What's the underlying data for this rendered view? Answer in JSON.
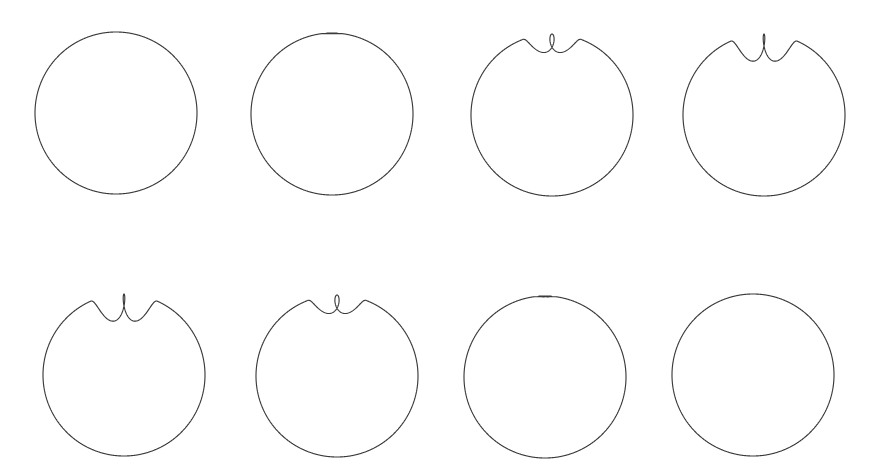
{
  "figure": {
    "background_color": "#ffffff",
    "stroke_color": "#3a3a3a",
    "stroke_width": 1.15,
    "canvas": {
      "width": 874,
      "height": 476
    },
    "grid": {
      "rows": 2,
      "columns": 4
    }
  },
  "chart_data": {
    "type": "line",
    "xlabel": "",
    "ylabel": "",
    "grid": false,
    "legend_position": "none",
    "curve_family": "epitrochoid",
    "parametric_form": "x = cx + (R + r) * cos(t) - d * cos(((R + r) / r) * t);  y = cy + (R + r) * sin(t) - d * sin(((R + r) / r) * t)",
    "panels": [
      {
        "index": 1,
        "row": 1,
        "column": 1,
        "label": "plain circle",
        "center": [
          116,
          113
        ],
        "radius": 81,
        "loop_amplitude": 0.0,
        "loop_width": 0,
        "loop_height": 0,
        "feature": "none"
      },
      {
        "index": 2,
        "row": 1,
        "column": 2,
        "label": "dimpled circle",
        "center": [
          332,
          114
        ],
        "radius": 81,
        "loop_amplitude": 0.16,
        "loop_width": 16,
        "loop_height": 7,
        "feature": "dimple"
      },
      {
        "index": 3,
        "row": 1,
        "column": 3,
        "label": "small crossing loop",
        "center": [
          552,
          115
        ],
        "radius": 81,
        "loop_amplitude": 0.62,
        "loop_width": 40,
        "loop_height": 58,
        "feature": "crossing-loop"
      },
      {
        "index": 4,
        "row": 1,
        "column": 4,
        "label": "large tangent loop",
        "center": [
          764,
          115
        ],
        "radius": 81,
        "loop_amplitude": 0.86,
        "loop_width": 42,
        "loop_height": 62,
        "feature": "tangent-loop"
      },
      {
        "index": 5,
        "row": 2,
        "column": 1,
        "label": "large tangent loop",
        "center": [
          124,
          375
        ],
        "radius": 81,
        "loop_amplitude": 0.86,
        "loop_width": 42,
        "loop_height": 62,
        "feature": "tangent-loop"
      },
      {
        "index": 6,
        "row": 2,
        "column": 2,
        "label": "small crossing loop",
        "center": [
          337,
          376
        ],
        "radius": 81,
        "loop_amplitude": 0.62,
        "loop_width": 40,
        "loop_height": 58,
        "feature": "crossing-loop"
      },
      {
        "index": 7,
        "row": 2,
        "column": 3,
        "label": "dimpled circle",
        "center": [
          545,
          377
        ],
        "radius": 81,
        "loop_amplitude": 0.16,
        "loop_width": 18,
        "loop_height": 7,
        "feature": "dimple"
      },
      {
        "index": 8,
        "row": 2,
        "column": 4,
        "label": "plain circle",
        "center": [
          753,
          375
        ],
        "radius": 81,
        "loop_amplitude": 0.0,
        "loop_width": 0,
        "loop_height": 0,
        "feature": "none"
      }
    ]
  }
}
